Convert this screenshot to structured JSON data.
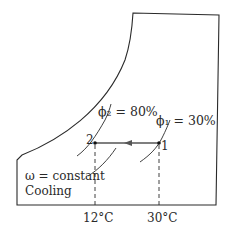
{
  "diagram": {
    "type": "psychrometric-process",
    "process_label": "Cooling",
    "constraint_label": "ω = constant",
    "states": [
      {
        "id": "2",
        "label": "2",
        "rh_label": "ϕ₂ = 80%",
        "temperature": "12°C"
      },
      {
        "id": "1",
        "label": "1",
        "rh_label": "ϕ₁ = 30%",
        "temperature": "30°C"
      }
    ],
    "colors": {
      "line": "#2a2a2a",
      "process_line": "#555555",
      "background": "#ffffff"
    }
  }
}
